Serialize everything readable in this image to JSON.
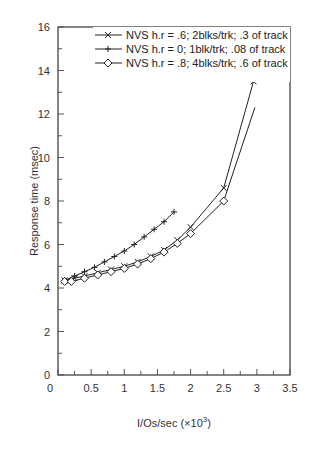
{
  "chart_data": {
    "type": "line",
    "title": "",
    "xlabel": "I/Os/sec (×10³)",
    "xlabel_base": "I/Os/sec (×10",
    "xlabel_sup": "3",
    "xlabel_tail": ")",
    "ylabel": "Response time (msec)",
    "xlim": [
      0,
      3.5
    ],
    "ylim": [
      0,
      16
    ],
    "xticks": [
      "0",
      "0.5",
      "1",
      "1.5",
      "2",
      "2.5",
      "3",
      "3.5"
    ],
    "yticks": [
      "0",
      "2",
      "4",
      "6",
      "8",
      "10",
      "12",
      "14",
      "16"
    ],
    "grid": false,
    "legend_position": "upper left, inside",
    "series": [
      {
        "name": "NVS h.r = .6; 2blks/trk; .3 of track",
        "marker": "x",
        "x": [
          0.1,
          0.25,
          0.4,
          0.6,
          0.8,
          1.0,
          1.2,
          1.4,
          1.6,
          1.8,
          2.0,
          2.5,
          2.95
        ],
        "y": [
          4.35,
          4.45,
          4.55,
          4.7,
          4.85,
          5.0,
          5.2,
          5.45,
          5.75,
          6.2,
          6.8,
          8.6,
          13.5
        ]
      },
      {
        "name": "NVS h.r = 0; 1blk/trk; .08 of track",
        "marker": "+",
        "x": [
          0.1,
          0.25,
          0.4,
          0.55,
          0.7,
          0.85,
          1.0,
          1.15,
          1.3,
          1.45,
          1.6,
          1.75
        ],
        "y": [
          4.35,
          4.55,
          4.75,
          4.95,
          5.2,
          5.45,
          5.7,
          6.0,
          6.35,
          6.7,
          7.05,
          7.5
        ]
      },
      {
        "name": "NVS h.r = .8; 4blks/trk; .6 of track",
        "marker": "diamond",
        "x": [
          0.1,
          0.2,
          0.4,
          0.6,
          0.8,
          1.0,
          1.2,
          1.4,
          1.6,
          1.8,
          2.0,
          2.5,
          2.97
        ],
        "y": [
          4.3,
          4.3,
          4.45,
          4.6,
          4.75,
          4.9,
          5.1,
          5.35,
          5.65,
          6.05,
          6.5,
          8.0,
          12.3
        ]
      }
    ]
  }
}
